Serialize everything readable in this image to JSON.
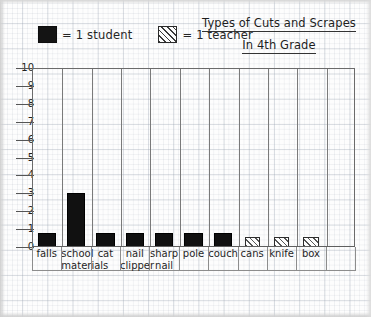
{
  "title": {
    "line1": "Types of Cuts and Scrapes",
    "line2": "In 4th Grade"
  },
  "legend": {
    "position": "top-left",
    "items": [
      {
        "swatch": "solid-black-square",
        "label": "= 1 student",
        "color": "#141414"
      },
      {
        "swatch": "diagonal-hatched-square",
        "label": "= 1 teacher",
        "color": "#ffffff"
      }
    ]
  },
  "axis": {
    "y_ticks": [
      "10",
      "9",
      "8",
      "7",
      "6",
      "5",
      "4",
      "3",
      "2",
      "1",
      "0"
    ]
  },
  "chart_data": {
    "type": "bar",
    "title": "Types of Cuts and Scrapes In 4th Grade",
    "xlabel": "",
    "ylabel": "",
    "ylim": [
      0,
      10
    ],
    "grid": true,
    "legend_position": "top-left",
    "categories": [
      "falls",
      "school materials",
      "cat",
      "nail clipper",
      "sharp nail",
      "pole",
      "couch",
      "cans",
      "knife",
      "box"
    ],
    "series": [
      {
        "name": "1 student",
        "fill": "solid",
        "values": [
          1,
          3,
          1,
          1,
          1,
          1,
          1,
          null,
          null,
          null
        ]
      },
      {
        "name": "1 teacher",
        "fill": "hatched",
        "values": [
          null,
          null,
          null,
          null,
          null,
          null,
          null,
          1,
          1,
          1
        ]
      }
    ],
    "bars": [
      {
        "category": "falls",
        "value": 1,
        "series": "1 student"
      },
      {
        "category": "school materials",
        "value": 3,
        "series": "1 student"
      },
      {
        "category": "cat",
        "value": 1,
        "series": "1 student"
      },
      {
        "category": "nail clipper",
        "value": 1,
        "series": "1 student"
      },
      {
        "category": "sharp nail",
        "value": 1,
        "series": "1 student"
      },
      {
        "category": "pole",
        "value": 1,
        "series": "1 student"
      },
      {
        "category": "couch",
        "value": 1,
        "series": "1 student"
      },
      {
        "category": "cans",
        "value": 1,
        "series": "1 teacher"
      },
      {
        "category": "knife",
        "value": 1,
        "series": "1 teacher"
      },
      {
        "category": "box",
        "value": 1,
        "series": "1 teacher"
      }
    ]
  }
}
